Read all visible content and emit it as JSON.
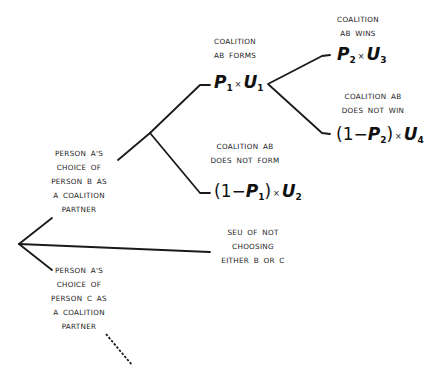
{
  "diagram": {
    "type": "decision-tree",
    "root": {
      "branches": [
        {
          "id": "choose-b",
          "label": "PERSON  A'S\nCHOICE  OF\nPERSON  B  AS\nA  COALITION\nPARTNER"
        },
        {
          "id": "choose-none",
          "label": "SEU  OF  NOT\nCHOOSING\nEITHER  B  OR  C"
        },
        {
          "id": "choose-c",
          "label": "PERSON  A'S\nCHOICE  OF\nPERSON  C  AS\nA  COALITION\nPARTNER"
        }
      ]
    },
    "nodes": {
      "forms": {
        "label": "COALITION\nAB  FORMS",
        "expr": {
          "p": "P",
          "p_sub": "1",
          "times": "×",
          "u": "U",
          "u_sub": "1"
        }
      },
      "not_form": {
        "label": "COALITION  AB\nDOES  NOT  FORM",
        "expr": {
          "open": "(1−",
          "p": "P",
          "p_sub": "1",
          "close": ")",
          "times": "×",
          "u": "U",
          "u_sub": "2"
        }
      },
      "wins": {
        "label": "COALITION\nAB  WINS",
        "expr": {
          "p": "P",
          "p_sub": "2",
          "times": "×",
          "u": "U",
          "u_sub": "3"
        }
      },
      "not_win": {
        "label": "COALITION  AB\nDOES  NOT  WIN",
        "expr": {
          "open": "(1−",
          "p": "P",
          "p_sub": "2",
          "close": ")",
          "times": "×",
          "u": "U",
          "u_sub": "4"
        }
      }
    },
    "line_color": "#1a1a1a"
  }
}
